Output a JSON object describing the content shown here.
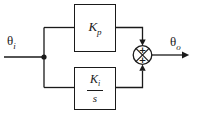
{
  "diagram": {
    "input_label": {
      "base": "θ",
      "sub": "i"
    },
    "output_label": {
      "base": "θ",
      "sub": "o"
    },
    "proportional_block": {
      "base": "K",
      "sub": "p"
    },
    "integral_block": {
      "num_base": "K",
      "num_sub": "i",
      "den": "s"
    },
    "summing_junction": {
      "top_sign": "+",
      "bottom_sign": "+"
    },
    "colors": {
      "ink": "#1a1a1a",
      "background": "#ffffff"
    }
  }
}
